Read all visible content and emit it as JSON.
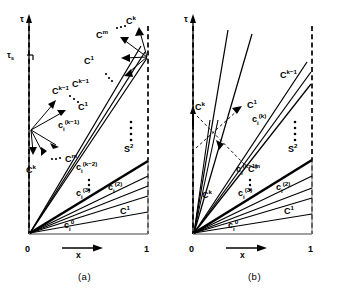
{
  "figure": {
    "type": "characteristics-diagram",
    "panels": [
      {
        "id": "a",
        "caption": "(a)",
        "axes": {
          "y_label": "τ",
          "x_label": "x",
          "y_tick_label": "τs",
          "x_tick_left": "0",
          "x_tick_right": "1"
        },
        "labels": {
          "left_fan_top": "C",
          "left_fan_top_sup": "k−1",
          "left_fan_mid": "C",
          "left_fan_mid_sup": "1",
          "left_fan_low": "C",
          "left_fan_low_sup": "m",
          "left_fan_bot": "C",
          "left_fan_bot_sup": "k",
          "right_fan_top": "C",
          "right_fan_top_sup": "k",
          "right_fan_upper": "C",
          "right_fan_upper_sup": "m",
          "right_fan_mid": "C",
          "right_fan_mid_sup": "1",
          "right_fan_low": "C",
          "right_fan_low_sup": "k−1",
          "char_km1": "c",
          "char_km1_sub": "i",
          "char_km1_sup": "(k−1)",
          "char_km2": "c",
          "char_km2_sub": "i",
          "char_km2_sup": "(k−2)",
          "char_3": "c",
          "char_3_sub": "i",
          "char_3_sup": "(3)",
          "char_2": "c",
          "char_2_sub": "i",
          "char_2_sup": "(2)",
          "char_0": "c",
          "char_0_sub": "i",
          "char_0_sup": "0",
          "shock": "S",
          "shock_sup": "2",
          "c1_right": "C",
          "c1_right_sup": "1",
          "vdots": "⋮"
        }
      },
      {
        "id": "b",
        "caption": "(b)",
        "axes": {
          "y_label": "τ",
          "x_label": "x",
          "x_tick_left": "0",
          "x_tick_right": "1"
        },
        "labels": {
          "left_ck_upper": "C",
          "left_ck_upper_sup": "k",
          "left_c1": "C",
          "left_c1_sup": "1",
          "left_cm": "C",
          "left_cm_sup": "m",
          "left_ck_lower": "C",
          "left_ck_lower_sup": "k",
          "right_ckm1": "C",
          "right_ckm1_sup": "k−1",
          "char_k": "c",
          "char_k_sub": "i",
          "char_k_sup": "(k)",
          "char_km1": "c",
          "char_km1_sub": "i",
          "char_km1_sup": "(k−1)",
          "char_3": "c",
          "char_3_sub": "i",
          "char_3_sup": "(3)",
          "char_2": "c",
          "char_2_sub": "i",
          "char_2_sup": "(2)",
          "char_0": "c",
          "char_0_sub": "i",
          "char_0_sup": "0",
          "shock": "S",
          "shock_sup": "2",
          "c1_right": "C",
          "c1_right_sup": "1",
          "vdots": "⋮"
        }
      }
    ],
    "colors": {
      "ink": "#000000",
      "boundary": "#000000",
      "axis": "#555555"
    }
  }
}
